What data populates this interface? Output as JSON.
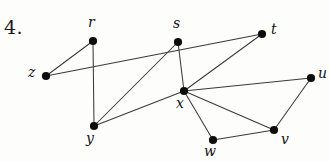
{
  "figure": {
    "problem_number": "4.",
    "type": "undirected-graph-diagram",
    "colors": {
      "background": "#fdfdfc",
      "edge": "#3a3a3a",
      "node": "#0d0d0d",
      "label": "#121212"
    },
    "vertices": [
      {
        "id": "r",
        "label": "r",
        "x": 93,
        "y": 41,
        "label_x": 88,
        "label_y": 14
      },
      {
        "id": "s",
        "label": "s",
        "x": 178,
        "y": 42,
        "label_x": 173,
        "label_y": 15
      },
      {
        "id": "t",
        "label": "t",
        "x": 262,
        "y": 34,
        "label_x": 271,
        "label_y": 21
      },
      {
        "id": "z",
        "label": "z",
        "x": 46,
        "y": 76,
        "label_x": 28,
        "label_y": 64
      },
      {
        "id": "u",
        "label": "u",
        "x": 311,
        "y": 78,
        "label_x": 318,
        "label_y": 65
      },
      {
        "id": "x",
        "label": "x",
        "x": 184,
        "y": 91,
        "label_x": 176,
        "label_y": 95
      },
      {
        "id": "y",
        "label": "y",
        "x": 94,
        "y": 126,
        "label_x": 86,
        "label_y": 130
      },
      {
        "id": "v",
        "label": "v",
        "x": 274,
        "y": 130,
        "label_x": 281,
        "label_y": 131
      },
      {
        "id": "w",
        "label": "w",
        "x": 213,
        "y": 140,
        "label_x": 204,
        "label_y": 143
      }
    ],
    "edges": [
      {
        "from": "z",
        "to": "r"
      },
      {
        "from": "z",
        "to": "t"
      },
      {
        "from": "r",
        "to": "y"
      },
      {
        "from": "s",
        "to": "y"
      },
      {
        "from": "s",
        "to": "x"
      },
      {
        "from": "x",
        "to": "t"
      },
      {
        "from": "x",
        "to": "u"
      },
      {
        "from": "x",
        "to": "v"
      },
      {
        "from": "x",
        "to": "w"
      },
      {
        "from": "x",
        "to": "y"
      },
      {
        "from": "w",
        "to": "v"
      },
      {
        "from": "v",
        "to": "u"
      }
    ]
  }
}
